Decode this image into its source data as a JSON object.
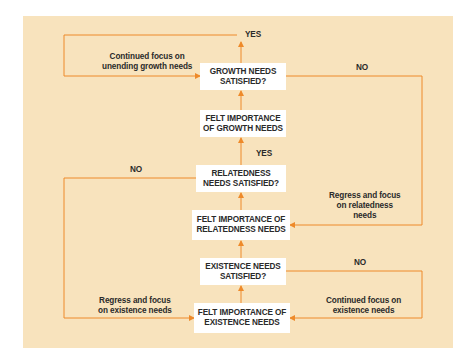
{
  "diagram": {
    "type": "flowchart",
    "colors": {
      "background_panel": "#f8e3bd",
      "connector": "#ee8a2a",
      "box": "#ffffff",
      "text": "#2a2a2a"
    },
    "nodes": {
      "growth_satisfied": {
        "line1": "GROWTH NEEDS",
        "line2": "SATISFIED?"
      },
      "felt_growth": {
        "line1": "FELT IMPORTANCE",
        "line2": "OF GROWTH NEEDS"
      },
      "relatedness_satisfied": {
        "line1": "RELATEDNESS",
        "line2": "NEEDS SATISFIED?"
      },
      "felt_relatedness": {
        "line1": "FELT IMPORTANCE OF",
        "line2": "RELATEDNESS NEEDS"
      },
      "existence_satisfied": {
        "line1": "EXISTENCE NEEDS",
        "line2": "SATISFIED?"
      },
      "felt_existence": {
        "line1": "FELT IMPORTANCE OF",
        "line2": "EXISTENCE NEEDS"
      }
    },
    "labels": {
      "yes_top": "YES",
      "yes_mid": "YES",
      "no_growth": "NO",
      "no_relatedness": "NO",
      "no_existence": "NO",
      "continued_growth": {
        "line1": "Continued focus on",
        "line2": "unending growth needs"
      },
      "regress_relatedness": {
        "line1": "Regress and focus",
        "line2": "on relatedness",
        "line3": "needs"
      },
      "regress_existence": {
        "line1": "Regress and focus",
        "line2": "on existence needs"
      },
      "continued_existence": {
        "line1": "Continued focus on",
        "line2": "existence needs"
      }
    }
  }
}
